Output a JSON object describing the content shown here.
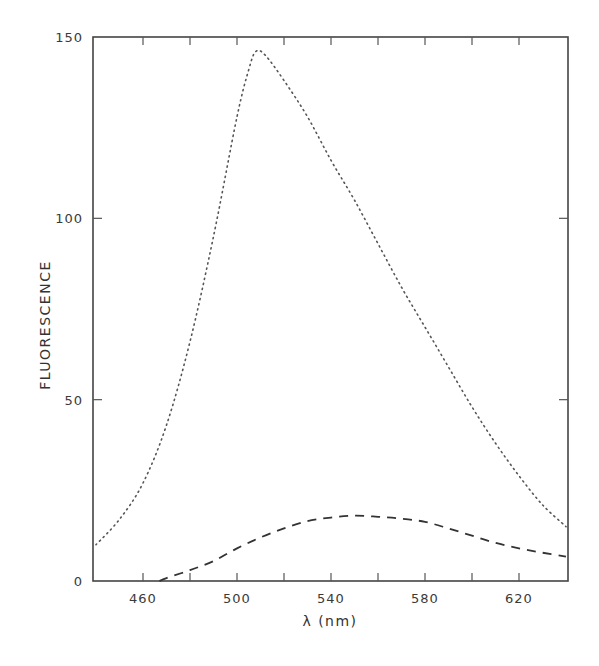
{
  "chart_data": {
    "type": "line",
    "title": "",
    "xlabel": "λ (nm)",
    "ylabel": "FLUORESCENCE",
    "xlim": [
      439,
      641
    ],
    "ylim": [
      0,
      150
    ],
    "x_ticks": [
      460,
      480,
      500,
      520,
      540,
      560,
      580,
      600,
      620
    ],
    "x_tick_labels": [
      "460",
      "500",
      "540",
      "580",
      "620"
    ],
    "x_tick_label_values": [
      460,
      500,
      540,
      580,
      620
    ],
    "y_ticks": [
      0,
      50,
      100,
      150
    ],
    "y_tick_labels": [
      "0",
      "50",
      "100",
      "150"
    ],
    "grid": false,
    "legend": null,
    "series": [
      {
        "name": "dotted",
        "style": "dotted",
        "x": [
          440,
          450,
          460,
          470,
          480,
          490,
          500,
          505,
          508,
          512,
          520,
          530,
          540,
          550,
          560,
          570,
          580,
          590,
          600,
          610,
          620,
          630,
          640
        ],
        "values": [
          10,
          17,
          27,
          43,
          66,
          95,
          128,
          141,
          146,
          145,
          138,
          128,
          116,
          105,
          93,
          81,
          70,
          59,
          48,
          38,
          29,
          21,
          15
        ]
      },
      {
        "name": "dashed",
        "style": "dashed",
        "x": [
          467,
          470,
          480,
          490,
          500,
          510,
          520,
          530,
          540,
          550,
          560,
          570,
          580,
          590,
          600,
          610,
          620,
          630,
          640
        ],
        "values": [
          0,
          0.8,
          3,
          5.5,
          9,
          12,
          14.5,
          16.5,
          17.5,
          18,
          17.7,
          17.2,
          16.3,
          14.5,
          12.5,
          10.5,
          9,
          7.8,
          6.7
        ]
      }
    ]
  }
}
